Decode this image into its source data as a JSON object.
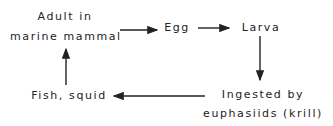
{
  "diagram": {
    "type": "life-cycle",
    "nodes": [
      {
        "id": "adult",
        "lines": [
          "Adult in",
          "marine mammal"
        ]
      },
      {
        "id": "egg",
        "lines": [
          "Egg"
        ]
      },
      {
        "id": "larva",
        "lines": [
          "Larva"
        ]
      },
      {
        "id": "krill",
        "lines": [
          "Ingested by",
          "euphasiids (krill)"
        ]
      },
      {
        "id": "fish",
        "lines": [
          "Fish, squid"
        ]
      }
    ],
    "edges": [
      {
        "from": "adult",
        "to": "egg"
      },
      {
        "from": "egg",
        "to": "larva"
      },
      {
        "from": "larva",
        "to": "krill"
      },
      {
        "from": "krill",
        "to": "fish"
      },
      {
        "from": "fish",
        "to": "adult"
      }
    ],
    "color": "#222222"
  }
}
